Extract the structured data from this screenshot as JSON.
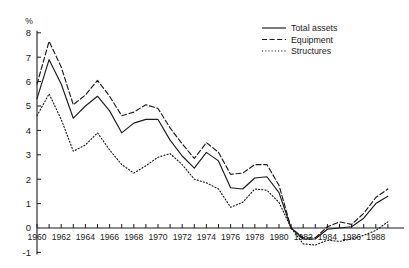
{
  "chart_data": {
    "type": "line",
    "title": "",
    "xlabel": "",
    "ylabel": "%",
    "unit_label": "%",
    "xlim": [
      1960,
      1989
    ],
    "ylim": [
      -1,
      8
    ],
    "grid": false,
    "legend_position": "top-right",
    "y_ticks": [
      -1,
      0,
      1,
      2,
      3,
      4,
      5,
      6,
      7,
      8
    ],
    "y_tick_labels": [
      "-1",
      "0",
      "1",
      "2",
      "3",
      "4",
      "5",
      "6",
      "7",
      "8"
    ],
    "x_ticks": [
      1960,
      1961,
      1962,
      1963,
      1964,
      1965,
      1966,
      1967,
      1968,
      1969,
      1970,
      1971,
      1972,
      1973,
      1974,
      1975,
      1976,
      1977,
      1978,
      1979,
      1980,
      1981,
      1982,
      1983,
      1984,
      1985,
      1986,
      1987,
      1988,
      1989
    ],
    "x_tick_labels_shown": [
      "1960",
      "1962",
      "1964",
      "1966",
      "1968",
      "1970",
      "1972",
      "1974",
      "1976",
      "1978",
      "1980",
      "1982",
      "1984",
      "1986",
      "1988"
    ],
    "x": [
      1960,
      1961,
      1962,
      1963,
      1964,
      1965,
      1966,
      1967,
      1968,
      1969,
      1970,
      1971,
      1972,
      1973,
      1974,
      1975,
      1976,
      1977,
      1978,
      1979,
      1980,
      1981,
      1982,
      1983,
      1984,
      1985,
      1986,
      1987,
      1988,
      1989
    ],
    "series": [
      {
        "name": "Total assets",
        "style": "solid",
        "values": [
          5.3,
          6.9,
          5.9,
          4.5,
          5.0,
          5.4,
          4.8,
          3.9,
          4.3,
          4.45,
          4.45,
          3.6,
          2.95,
          2.45,
          3.1,
          2.75,
          1.65,
          1.6,
          2.05,
          2.1,
          1.45,
          0.0,
          -0.45,
          -0.45,
          -0.05,
          0.0,
          0.05,
          0.4,
          1.0,
          1.3
        ]
      },
      {
        "name": "Equipment",
        "style": "dashed",
        "values": [
          5.9,
          7.65,
          6.6,
          5.05,
          5.45,
          6.05,
          5.4,
          4.6,
          4.75,
          5.05,
          4.9,
          4.1,
          3.45,
          2.85,
          3.5,
          3.1,
          2.2,
          2.25,
          2.6,
          2.6,
          1.75,
          0.0,
          -0.4,
          -0.4,
          0.05,
          0.25,
          0.15,
          0.6,
          1.25,
          1.6
        ]
      },
      {
        "name": "Structures",
        "style": "dotted",
        "values": [
          4.6,
          5.5,
          4.45,
          3.15,
          3.4,
          3.9,
          3.2,
          2.6,
          2.25,
          2.55,
          2.9,
          3.05,
          2.6,
          2.0,
          1.85,
          1.6,
          0.85,
          1.05,
          1.6,
          1.55,
          1.05,
          0.0,
          -0.65,
          -0.7,
          -0.5,
          -0.55,
          -0.45,
          -0.3,
          -0.1,
          0.25
        ]
      }
    ],
    "legend": [
      {
        "label": "Total assets",
        "style": "solid"
      },
      {
        "label": "Equipment",
        "style": "dashed"
      },
      {
        "label": "Structures",
        "style": "dotted"
      }
    ]
  }
}
